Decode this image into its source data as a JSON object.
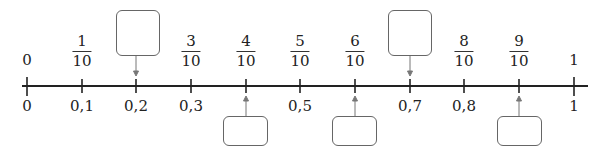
{
  "number_line": {
    "ticks": [
      {
        "decimal": "0",
        "top": "0",
        "fraction": null
      },
      {
        "decimal": "0,1",
        "top": null,
        "fraction": {
          "num": "1",
          "den": "10"
        }
      },
      {
        "decimal": "0,2",
        "top": null,
        "fraction": null,
        "blank_top": true
      },
      {
        "decimal": "0,3",
        "top": null,
        "fraction": {
          "num": "3",
          "den": "10"
        }
      },
      {
        "decimal": null,
        "top": null,
        "fraction": {
          "num": "4",
          "den": "10"
        },
        "blank_bottom": true
      },
      {
        "decimal": "0,5",
        "top": null,
        "fraction": {
          "num": "5",
          "den": "10"
        }
      },
      {
        "decimal": null,
        "top": null,
        "fraction": {
          "num": "6",
          "den": "10"
        },
        "blank_bottom": true
      },
      {
        "decimal": "0,7",
        "top": null,
        "fraction": null,
        "blank_top": true
      },
      {
        "decimal": "0,8",
        "top": null,
        "fraction": {
          "num": "8",
          "den": "10"
        }
      },
      {
        "decimal": null,
        "top": null,
        "fraction": {
          "num": "9",
          "den": "10"
        },
        "blank_bottom": true
      },
      {
        "decimal": "1",
        "top": "1",
        "fraction": null
      }
    ],
    "labels": {
      "t0_top": "0",
      "t0_bottom": "0",
      "t1_num": "1",
      "t1_den": "10",
      "t1_bottom": "0,1",
      "t2_bottom": "0,2",
      "t3_num": "3",
      "t3_den": "10",
      "t3_bottom": "0,3",
      "t4_num": "4",
      "t4_den": "10",
      "t5_num": "5",
      "t5_den": "10",
      "t5_bottom": "0,5",
      "t6_num": "6",
      "t6_den": "10",
      "t7_bottom": "0,7",
      "t8_num": "8",
      "t8_den": "10",
      "t8_bottom": "0,8",
      "t9_num": "9",
      "t9_den": "10",
      "t10_top": "1",
      "t10_bottom": "1"
    },
    "answer_boxes": [
      {
        "tick": "0,2",
        "position": "above",
        "value": ""
      },
      {
        "tick": "4/10",
        "position": "below",
        "value": ""
      },
      {
        "tick": "6/10",
        "position": "below",
        "value": ""
      },
      {
        "tick": "0,7",
        "position": "above",
        "value": ""
      },
      {
        "tick": "9/10",
        "position": "below",
        "value": ""
      }
    ],
    "colors": {
      "axis": "#222222",
      "box_border": "#666666",
      "arrow": "#777777"
    }
  }
}
